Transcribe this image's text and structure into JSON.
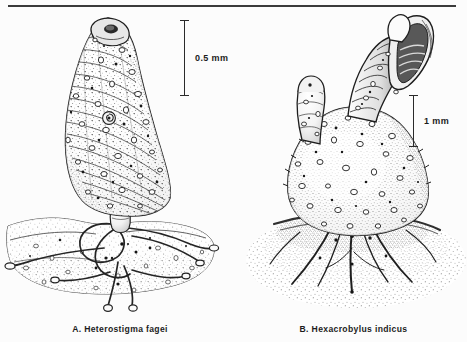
{
  "figure": {
    "background_color": "#fcfcfc",
    "ink_color": "#1c1c1c",
    "rule_color": "#3b3b3b"
  },
  "panels": [
    {
      "id": "A",
      "label": "A.",
      "genus": "Heterostigma",
      "species": "fagei",
      "caption": "A.  Heterostigma  fagei",
      "subject": "ascidian-body-with-stolons",
      "scalebar": {
        "value": "0.5",
        "unit": "mm",
        "label": "0.5  mm"
      }
    },
    {
      "id": "B",
      "label": "B.",
      "genus": "Hexacrobylus",
      "species": "indicus",
      "caption": "B.  Hexacrobylus  indicus",
      "subject": "ascidian-body-with-flared-siphon",
      "scalebar": {
        "value": "1",
        "unit": "mm",
        "label": "1  mm"
      }
    }
  ]
}
